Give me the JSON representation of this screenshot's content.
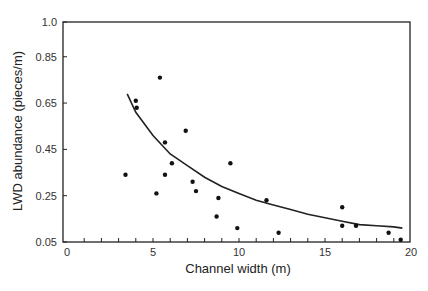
{
  "chart_data": {
    "type": "scatter",
    "title": "",
    "xlabel": "Channel width (m)",
    "ylabel": "LWD abundance (pieces/m)",
    "xlim": [
      0,
      20
    ],
    "ylim": [
      0.05,
      1.0
    ],
    "x_ticks": [
      0,
      5,
      10,
      15,
      20
    ],
    "y_ticks": [
      0.05,
      0.25,
      0.45,
      0.65,
      0.85,
      1.0
    ],
    "y_tick_labels": [
      "0.05",
      "0.25",
      "0.45",
      "0.65",
      "0.85",
      "1.0"
    ],
    "grid": false,
    "legend": null,
    "series": [
      {
        "name": "observations",
        "kind": "scatter",
        "points": [
          [
            3.4,
            0.34
          ],
          [
            4.0,
            0.66
          ],
          [
            4.05,
            0.63
          ],
          [
            5.2,
            0.26
          ],
          [
            5.4,
            0.76
          ],
          [
            5.7,
            0.34
          ],
          [
            5.7,
            0.48
          ],
          [
            6.1,
            0.39
          ],
          [
            6.9,
            0.53
          ],
          [
            7.3,
            0.31
          ],
          [
            7.5,
            0.27
          ],
          [
            8.8,
            0.24
          ],
          [
            8.7,
            0.16
          ],
          [
            9.5,
            0.39
          ],
          [
            9.9,
            0.11
          ],
          [
            11.6,
            0.23
          ],
          [
            12.3,
            0.09
          ],
          [
            16.0,
            0.2
          ],
          [
            16.0,
            0.12
          ],
          [
            16.8,
            0.12
          ],
          [
            18.7,
            0.09
          ],
          [
            19.4,
            0.06
          ]
        ]
      },
      {
        "name": "fitted curve",
        "kind": "line",
        "points": [
          [
            3.5,
            0.69
          ],
          [
            4.0,
            0.61
          ],
          [
            5.0,
            0.51
          ],
          [
            6.0,
            0.43
          ],
          [
            7.0,
            0.38
          ],
          [
            8.0,
            0.33
          ],
          [
            9.0,
            0.29
          ],
          [
            10.0,
            0.26
          ],
          [
            11.0,
            0.23
          ],
          [
            12.0,
            0.21
          ],
          [
            13.0,
            0.19
          ],
          [
            14.0,
            0.17
          ],
          [
            15.0,
            0.155
          ],
          [
            16.0,
            0.14
          ],
          [
            17.0,
            0.125
          ],
          [
            18.0,
            0.12
          ],
          [
            19.0,
            0.115
          ],
          [
            19.5,
            0.11
          ]
        ]
      }
    ]
  }
}
